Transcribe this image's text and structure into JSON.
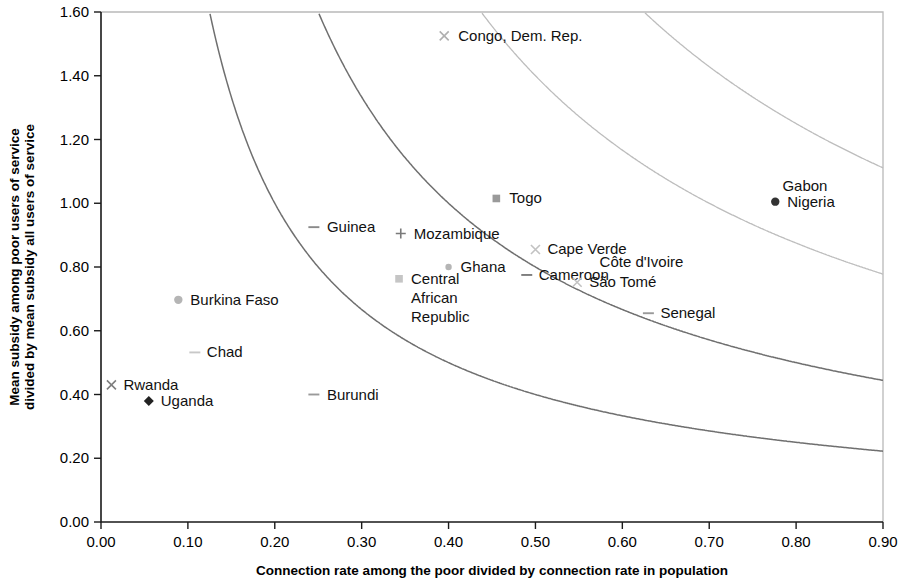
{
  "chart_data": {
    "type": "scatter",
    "title": "",
    "xlabel": "Connection rate among the poor divided by connection rate in population",
    "ylabel": "Mean subsidy among poor users of service divided by mean subsidy all users of service",
    "xlim": [
      0.0,
      0.9
    ],
    "ylim": [
      0.0,
      1.6
    ],
    "xticks": [
      "0.00",
      "0.10",
      "0.20",
      "0.30",
      "0.40",
      "0.50",
      "0.60",
      "0.70",
      "0.80",
      "0.90"
    ],
    "yticks": [
      "0.00",
      "0.20",
      "0.40",
      "0.60",
      "0.80",
      "1.00",
      "1.20",
      "1.40",
      "1.60"
    ],
    "grid": false,
    "legend": "none",
    "points": [
      {
        "label": "Congo, Dem. Rep.",
        "x": 0.395,
        "y": 1.525,
        "marker": "x",
        "color": "#b0b0b0",
        "label_dx": 14,
        "label_dy": 5
      },
      {
        "label": "Togo",
        "x": 0.455,
        "y": 1.015,
        "marker": "square",
        "color": "#9a9a9a",
        "label_dx": 13,
        "label_dy": 5
      },
      {
        "label": "Gabon",
        "x": 0.775,
        "y": 1.055,
        "marker": "none",
        "color": "#555555",
        "label_dx": 8,
        "label_dy": 5
      },
      {
        "label": "Nigeria",
        "x": 0.776,
        "y": 1.005,
        "marker": "circle",
        "color": "#333333",
        "label_dx": 12,
        "label_dy": 5
      },
      {
        "label": "Guinea",
        "x": 0.245,
        "y": 0.925,
        "marker": "dash",
        "color": "#8a8a8a",
        "label_dx": 13,
        "label_dy": 5
      },
      {
        "label": "Mozambique",
        "x": 0.345,
        "y": 0.905,
        "marker": "plus",
        "color": "#7a7a7a",
        "label_dx": 13,
        "label_dy": 5
      },
      {
        "label": "Cape Verde",
        "x": 0.5,
        "y": 0.855,
        "marker": "x",
        "color": "#c2c2c2",
        "label_dx": 12,
        "label_dy": 5
      },
      {
        "label": "Côte d'Ivoire",
        "x": 0.56,
        "y": 0.815,
        "marker": "none",
        "color": "#c2c2c2",
        "label_dx": 12,
        "label_dy": 5
      },
      {
        "label": "Ghana",
        "x": 0.4,
        "y": 0.8,
        "marker": "dot",
        "color": "#b5b5b5",
        "label_dx": 12,
        "label_dy": 5
      },
      {
        "label": "Cameroon",
        "x": 0.49,
        "y": 0.775,
        "marker": "dash",
        "color": "#7e7e7e",
        "label_dx": 12,
        "label_dy": 5
      },
      {
        "label": "São Tomé",
        "x": 0.548,
        "y": 0.752,
        "marker": "x",
        "color": "#c2c2c2",
        "label_dx": 12,
        "label_dy": 5
      },
      {
        "label": "Central African Republic",
        "x": 0.343,
        "y": 0.763,
        "marker": "square",
        "color": "#c5c5c5",
        "label_dx": 12,
        "label_dy": 5
      },
      {
        "label": "Burkina Faso",
        "x": 0.089,
        "y": 0.697,
        "marker": "circle",
        "color": "#b5b5b5",
        "label_dx": 12,
        "label_dy": 5
      },
      {
        "label": "Senegal",
        "x": 0.63,
        "y": 0.655,
        "marker": "dash",
        "color": "#9a9a9a",
        "label_dx": 12,
        "label_dy": 5
      },
      {
        "label": "Chad",
        "x": 0.108,
        "y": 0.532,
        "marker": "dash",
        "color": "#c8c8c8",
        "label_dx": 12,
        "label_dy": 5
      },
      {
        "label": "Rwanda",
        "x": 0.012,
        "y": 0.43,
        "marker": "x",
        "color": "#7e7e7e",
        "label_dx": 12,
        "label_dy": 5
      },
      {
        "label": "Burundi",
        "x": 0.245,
        "y": 0.4,
        "marker": "dash",
        "color": "#9a9a9a",
        "label_dx": 13,
        "label_dy": 5
      },
      {
        "label": "Uganda",
        "x": 0.055,
        "y": 0.38,
        "marker": "diamond",
        "color": "#222222",
        "label_dx": 12,
        "label_dy": 5
      }
    ],
    "curves": [
      {
        "name": "iso-curve-1.0",
        "k": 1.0,
        "style": "faint"
      },
      {
        "name": "iso-curve-0.7",
        "k": 0.7,
        "style": "faint"
      },
      {
        "name": "iso-curve-0.4",
        "k": 0.4,
        "style": "solid"
      },
      {
        "name": "iso-curve-0.2",
        "k": 0.2,
        "style": "solid"
      }
    ]
  }
}
